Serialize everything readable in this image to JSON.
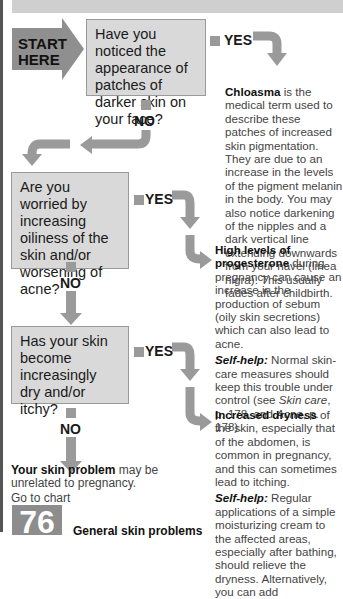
{
  "header": {
    "bar": ""
  },
  "start": {
    "label_line1": "START",
    "label_line2": "HERE"
  },
  "questions": [
    {
      "text": "Have you noticed the appearance of patches of darker skin on your face?",
      "yes": "YES",
      "no": "NO"
    },
    {
      "text": "Are you worried by increasing oiliness of the skin and/or worsening of acne?",
      "yes": "YES",
      "no": "NO"
    },
    {
      "text": "Has your skin become increasingly dry and/or itchy?",
      "yes": "YES",
      "no": "NO"
    }
  ],
  "answers": [
    {
      "bold": "Chloasma",
      "text": " is the medical term used to describe these patches of increased skin pigmentation. They are due to an increase in the levels of the pigment melanin in the body. You may also notice darkening of the nipples and a dark vertical line extending downwards from your navel (linea nigra). This usually fades after childbirth."
    },
    {
      "bold": "High levels of progesterone",
      "text": " during pregnancy can cause an increase in the production of sebum (oily skin secretions) which can also lead to acne.",
      "selfhelp_label": "Self-help:",
      "selfhelp_text": " Normal skin-care measures should keep this trouble under control (see ",
      "link1": "Skin care",
      "mid": ", p. 178, and ",
      "link2": "Acne",
      "end": ", p. 178)."
    },
    {
      "bold": "Increased dryness",
      "text": " of the skin, especially that of the abdomen, is common in pregnancy, and this can sometimes lead to itching.",
      "selfhelp_label": "Self-help:",
      "selfhelp_text": " Regular applications of a simple moisturizing cream to the affected areas, especially after bathing, should relieve the dryness. Alternatively, you can add"
    }
  ],
  "fallback": {
    "bold": "Your skin problem",
    "text": " may be unrelated to pregnancy.",
    "goto": "Go to chart",
    "chart_number": "76",
    "chart_title": "General skin problems"
  }
}
